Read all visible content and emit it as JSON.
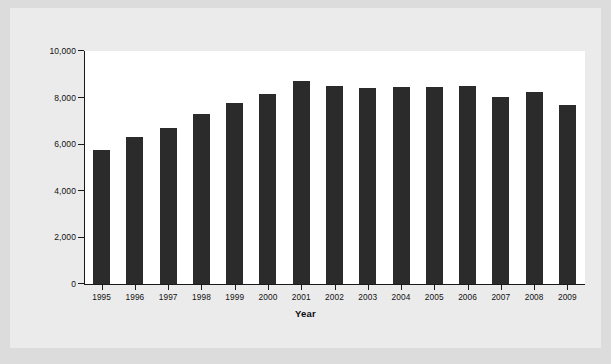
{
  "chart_data": {
    "type": "bar",
    "title": "",
    "xlabel": "Year",
    "ylabel": "Number of Mutual Funds",
    "categories": [
      "1995",
      "1996",
      "1997",
      "1998",
      "1999",
      "2000",
      "2001",
      "2002",
      "2003",
      "2004",
      "2005",
      "2006",
      "2007",
      "2008",
      "2009"
    ],
    "values": [
      5750,
      6290,
      6710,
      7310,
      7790,
      8160,
      8720,
      8510,
      8430,
      8440,
      8470,
      8480,
      8030,
      8250,
      7690
    ],
    "ylim": [
      0,
      10000
    ],
    "yticks": [
      0,
      2000,
      4000,
      6000,
      8000,
      10000
    ],
    "ytick_labels": [
      "0",
      "2,000",
      "4,000",
      "6,000",
      "8,000",
      "10,000"
    ],
    "grid": false,
    "legend": null,
    "bar_color": "#2b2b2b",
    "axis_color": "#1a1a1a",
    "plot_background": "#ffffff",
    "figure_background": "#ebebeb"
  }
}
